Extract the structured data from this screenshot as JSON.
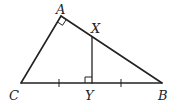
{
  "diagram": {
    "type": "geometry-triangle",
    "points": {
      "A": {
        "label": "A",
        "x": 61,
        "y": 16
      },
      "B": {
        "label": "B",
        "x": 162,
        "y": 83
      },
      "C": {
        "label": "C",
        "x": 21,
        "y": 83
      },
      "X": {
        "label": "X",
        "x": 92,
        "y": 38
      },
      "Y": {
        "label": "Y",
        "x": 92,
        "y": 83
      }
    },
    "segments": [
      "AC",
      "AB",
      "CB",
      "XY"
    ],
    "right_angles": [
      "A",
      "Y"
    ],
    "tick_marks": [
      {
        "segment": "CY",
        "count": 1
      },
      {
        "segment": "YB",
        "count": 1
      }
    ],
    "colors": {
      "stroke": "#222222",
      "background": "#ffffff"
    }
  }
}
